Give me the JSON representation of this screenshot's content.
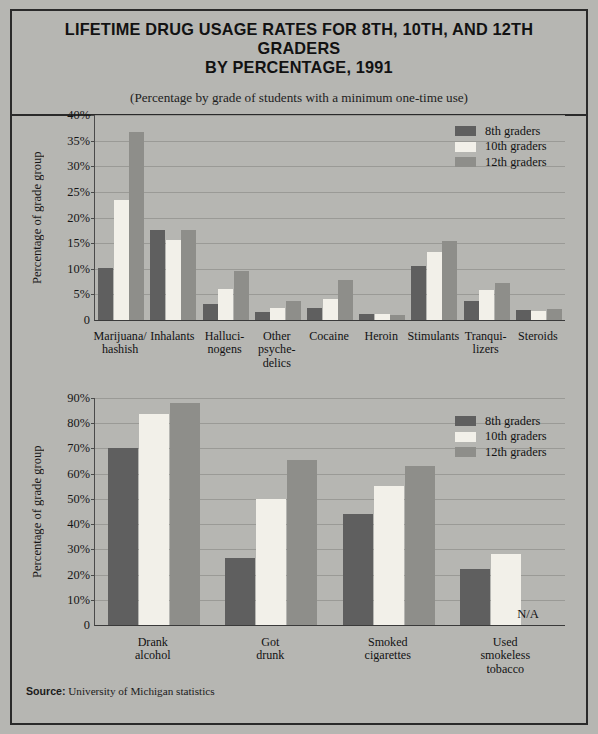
{
  "header": {
    "title": "LIFETIME DRUG USAGE RATES FOR 8TH, 10TH, AND 12TH GRADERS\nBY PERCENTAGE, 1991",
    "subtitle": "(Percentage by grade of students with a minimum one-time use)"
  },
  "source": {
    "label": "Source:",
    "text": "University of Michigan statistics"
  },
  "legend": {
    "g8": "8th graders",
    "g10": "10th graders",
    "g12": "12th graders"
  },
  "colors": {
    "grade8": "#5f5f5f",
    "grade10": "#f2f0e9",
    "grade12": "#8e8e8a",
    "background": "#b6b6b2",
    "frame": "#2a2a2a",
    "gridline": "#9a9a96"
  },
  "na_text": "N/A",
  "chart_data": [
    {
      "type": "bar",
      "id": "illicit-drugs",
      "title": "LIFETIME DRUG USAGE RATES FOR 8TH, 10TH, AND 12TH GRADERS BY PERCENTAGE, 1991",
      "xlabel": "",
      "ylabel": "Percentage of grade group",
      "ylim": [
        0,
        40
      ],
      "yticks": [
        0,
        5,
        10,
        15,
        20,
        25,
        30,
        35,
        40
      ],
      "ytick_labels": [
        "0",
        "5%",
        "10%",
        "15%",
        "20%",
        "25%",
        "30%",
        "35%",
        "40%"
      ],
      "grid": true,
      "legend_position": "top-right",
      "categories": [
        "Marijuana/\nhashish",
        "Inhalants",
        "Halluci-\nnogens",
        "Other\npsyche-\ndelics",
        "Cocaine",
        "Heroin",
        "Stimulants",
        "Tranqui-\nlizers",
        "Steroids"
      ],
      "series": [
        {
          "name": "8th graders",
          "values": [
            10.2,
            17.6,
            3.2,
            1.5,
            2.3,
            1.2,
            10.5,
            3.8,
            1.9
          ]
        },
        {
          "name": "10th graders",
          "values": [
            23.4,
            15.7,
            6.1,
            2.3,
            4.1,
            1.2,
            13.2,
            5.8,
            1.8
          ]
        },
        {
          "name": "12th graders",
          "values": [
            36.7,
            17.6,
            9.6,
            3.8,
            7.8,
            0.9,
            15.4,
            7.2,
            2.1
          ]
        }
      ]
    },
    {
      "type": "bar",
      "id": "alcohol-tobacco",
      "title": "",
      "xlabel": "",
      "ylabel": "Percentage of grade group",
      "ylim": [
        0,
        90
      ],
      "yticks": [
        0,
        10,
        20,
        30,
        40,
        50,
        60,
        70,
        80,
        90
      ],
      "ytick_labels": [
        "0",
        "10%",
        "20%",
        "30%",
        "40%",
        "50%",
        "60%",
        "70%",
        "80%",
        "90%"
      ],
      "grid": true,
      "legend_position": "top-right",
      "categories": [
        "Drank\nalcohol",
        "Got\ndrunk",
        "Smoked\ncigarettes",
        "Used\nsmokeless\ntobacco"
      ],
      "series": [
        {
          "name": "8th graders",
          "values": [
            70.1,
            26.7,
            44.0,
            22.2
          ]
        },
        {
          "name": "10th graders",
          "values": [
            83.8,
            50.0,
            55.1,
            28.2
          ]
        },
        {
          "name": "12th graders",
          "values": [
            88.0,
            65.4,
            63.1,
            null
          ]
        }
      ],
      "annotations": [
        {
          "text": "N/A",
          "category": "Used\nsmokeless\ntobacco",
          "series": "12th graders"
        }
      ]
    }
  ]
}
